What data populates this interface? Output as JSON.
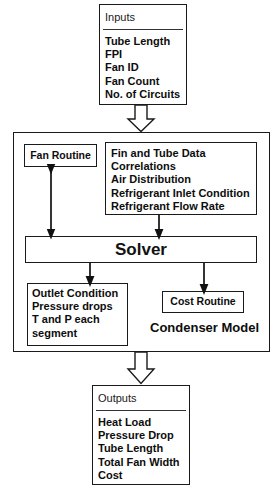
{
  "diagram": {
    "inputs": {
      "header": "Inputs",
      "items": [
        "Tube Length",
        "FPI",
        "Fan ID",
        "Fan Count",
        "No. of Circuits"
      ]
    },
    "condenser_model": {
      "label": "Condenser Model",
      "fan_routine": "Fan Routine",
      "data": {
        "items": [
          "Fin and Tube Data",
          "Correlations",
          "Air Distribution",
          "Refrigerant Inlet Condition",
          "Refrigerant Flow Rate"
        ]
      },
      "solver": "Solver",
      "outlet": {
        "items": [
          "Outlet Condition",
          "Pressure drops",
          "T and P each",
          "segment"
        ]
      },
      "cost_routine": "Cost Routine"
    },
    "outputs": {
      "header": "Outputs",
      "items": [
        "Heat Load",
        "Pressure Drop",
        "Tube Length",
        "Total Fan Width",
        "Cost"
      ]
    },
    "connectors": [
      {
        "name": "inputs-to-condenser",
        "style": "block-arrow",
        "direction": "down"
      },
      {
        "name": "data-to-solver",
        "style": "line-arrow",
        "direction": "down"
      },
      {
        "name": "fan-routine-to-solver",
        "style": "line-arrow",
        "direction": "both"
      },
      {
        "name": "solver-to-outlet",
        "style": "line-arrow",
        "direction": "down"
      },
      {
        "name": "solver-to-cost-routine",
        "style": "line-arrow",
        "direction": "down"
      },
      {
        "name": "condenser-to-outputs",
        "style": "block-arrow",
        "direction": "down"
      }
    ],
    "colors": {
      "stroke": "#1a1a1a",
      "text": "#0d0d0d",
      "background": "#ffffff"
    }
  }
}
